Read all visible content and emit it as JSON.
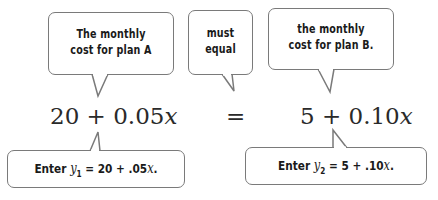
{
  "callouts_top": [
    {
      "line1": "The monthly",
      "line2": "cost for plan A"
    },
    {
      "line1": "must",
      "line2": "equal"
    },
    {
      "line1": "the monthly",
      "line2": "cost for plan B."
    }
  ],
  "equation": {
    "left": {
      "constant": "20",
      "op": "+",
      "coef": "0.05",
      "var": "x"
    },
    "equals": "=",
    "right": {
      "constant": "5",
      "op": "+",
      "coef": "0.10",
      "var": "x"
    }
  },
  "callouts_bottom": [
    {
      "prefix": "Enter",
      "var": "y",
      "sub": "1",
      "rest_pre": " = 20 + .05",
      "rest_var": "x",
      "rest_post": "."
    },
    {
      "prefix": "Enter",
      "var": "y",
      "sub": "2",
      "rest_pre": " =  5 + .10",
      "rest_var": "x",
      "rest_post": "."
    }
  ],
  "colors": {
    "border": "#7a7a7a",
    "text": "#1a1a1a"
  }
}
